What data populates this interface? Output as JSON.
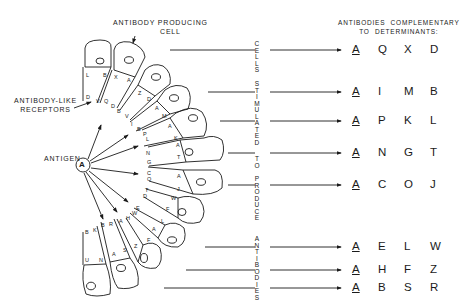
{
  "labels": {
    "cell": "ANTIBODY PRODUCING\nCELL",
    "cell_line1": "ANTIBODY PRODUCING",
    "cell_line2": "CELL",
    "receptors_line1": "ANTIBODY-LIKE",
    "receptors_line2": "RECEPTORS",
    "antigen": "ANTIGEN",
    "antigen_symbol": "A",
    "header_line1": "ANTIBODIES  COMPLEMENTARY",
    "header_line2": "TO  DETERMINANTS:"
  },
  "vertical_text": [
    "CELLS",
    "STIMULATED",
    "TO",
    "PRODUCE",
    "ANTIBODIES"
  ],
  "rows": [
    {
      "y": 50,
      "determinants": [
        "A",
        "Q",
        "X",
        "D"
      ]
    },
    {
      "y": 92,
      "determinants": [
        "A",
        "I",
        "M",
        "B"
      ]
    },
    {
      "y": 121,
      "determinants": [
        "A",
        "P",
        "K",
        "L"
      ]
    },
    {
      "y": 153,
      "determinants": [
        "A",
        "N",
        "G",
        "T"
      ]
    },
    {
      "y": 185,
      "determinants": [
        "A",
        "C",
        "O",
        "J"
      ]
    },
    {
      "y": 247,
      "determinants": [
        "A",
        "E",
        "L",
        "W"
      ]
    },
    {
      "y": 270,
      "determinants": [
        "A",
        "H",
        "F",
        "Z"
      ]
    },
    {
      "y": 288,
      "determinants": [
        "A",
        "B",
        "S",
        "R"
      ]
    }
  ],
  "cells": [
    {
      "receptors": [
        "L",
        "B",
        "D",
        "V"
      ]
    },
    {
      "receptors": [
        "X",
        "A",
        "Q",
        "D"
      ]
    },
    {
      "receptors": [
        "Z",
        "D",
        "B",
        "V"
      ]
    },
    {
      "receptors": [
        "A",
        "M",
        "I",
        "B"
      ]
    },
    {
      "receptors": [
        "A",
        "K",
        "P",
        "L"
      ]
    },
    {
      "receptors": [
        "A",
        "T",
        "N",
        "G"
      ]
    },
    {
      "receptors": [
        "A",
        "J",
        "C",
        "O"
      ]
    },
    {
      "receptors": [
        "W",
        "F",
        "T",
        "D"
      ]
    },
    {
      "receptors": [
        "L",
        "A",
        "E",
        "W"
      ]
    },
    {
      "receptors": [
        "F",
        "Z",
        "H",
        "A"
      ]
    },
    {
      "receptors": [
        "R",
        "S",
        "B",
        "A"
      ]
    },
    {
      "receptors": [
        "B",
        "K",
        "U",
        "N"
      ]
    }
  ]
}
